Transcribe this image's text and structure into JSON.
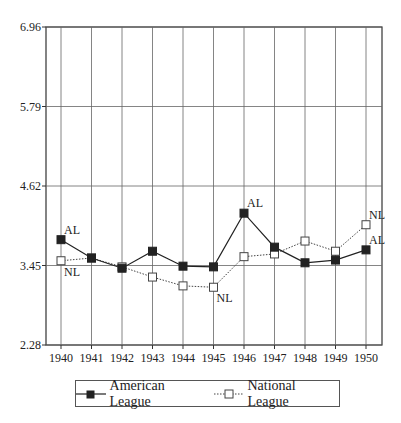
{
  "chart_data": {
    "type": "line",
    "title": "",
    "xlabel": "",
    "ylabel": "",
    "x": [
      1940,
      1941,
      1942,
      1943,
      1944,
      1945,
      1946,
      1947,
      1948,
      1949,
      1950
    ],
    "series": [
      {
        "name": "American League",
        "marker": "filled-square",
        "line": "solid",
        "values": [
          3.83,
          3.56,
          3.41,
          3.66,
          3.44,
          3.43,
          4.22,
          3.72,
          3.49,
          3.53,
          3.68
        ]
      },
      {
        "name": "National League",
        "marker": "open-square",
        "line": "dotted",
        "values": [
          3.52,
          3.56,
          3.43,
          3.28,
          3.15,
          3.13,
          3.58,
          3.62,
          3.81,
          3.66,
          4.05
        ]
      }
    ],
    "yticks": [
      "2.28",
      "3.45",
      "4.62",
      "5.79",
      "6.96"
    ],
    "ylim": [
      2.28,
      6.96
    ],
    "grid": true,
    "legend_position": "bottom",
    "annotations": [
      {
        "text": "AL",
        "x": 1940,
        "series": "American League",
        "pos": "above"
      },
      {
        "text": "NL",
        "x": 1940,
        "series": "National League",
        "pos": "below"
      },
      {
        "text": "NL",
        "x": 1945,
        "series": "National League",
        "pos": "below"
      },
      {
        "text": "AL",
        "x": 1946,
        "series": "American League",
        "pos": "above"
      },
      {
        "text": "NL",
        "x": 1950,
        "series": "National League",
        "pos": "above"
      },
      {
        "text": "AL",
        "x": 1950,
        "series": "American League",
        "pos": "above"
      }
    ]
  },
  "legend": {
    "items": [
      {
        "label": "American League"
      },
      {
        "label": "National League"
      }
    ]
  }
}
